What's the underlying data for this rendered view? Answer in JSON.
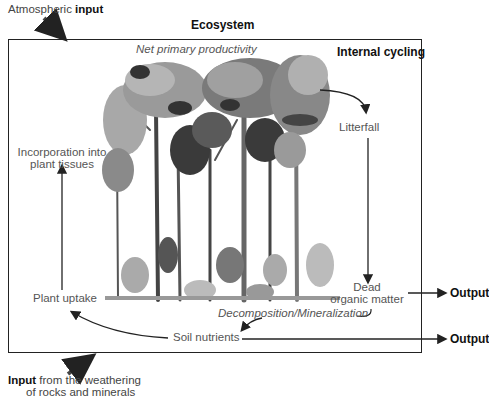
{
  "title": "Ecosystem",
  "inputs": {
    "atmospheric": {
      "prefix": "Atmospheric ",
      "bold": "input"
    },
    "weathering": {
      "bold": "Input",
      "suffix": " from the weathering",
      "line2": "of rocks and minerals"
    }
  },
  "labels": {
    "net_primary_productivity": "Net primary productivity",
    "internal_cycling": "Internal cycling",
    "litterfall": "Litterfall",
    "dead_organic_matter_1": "Dead",
    "dead_organic_matter_2": "organic matter",
    "decomposition": "Decomposition/Mineralization",
    "soil_nutrients": "Soil nutrients",
    "plant_uptake": "Plant uptake",
    "incorporation_1": "Incorporation into",
    "incorporation_2": "plant tissues"
  },
  "outputs": [
    "Output",
    "Output"
  ],
  "colors": {
    "line": "#222222",
    "label": "#555555",
    "tree_dark": "#3a3a3a",
    "tree_mid": "#7a7a7a",
    "tree_light": "#a8a8a8"
  }
}
